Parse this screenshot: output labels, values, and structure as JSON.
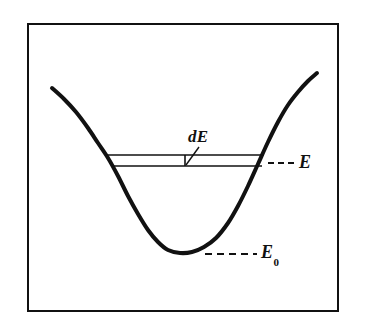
{
  "figure": {
    "kind": "potential-energy-well-diagram",
    "background_color": "#ffffff",
    "ink_color": "#111111",
    "frame": {
      "name": "figure-border",
      "x": 28,
      "y": 24,
      "width": 310,
      "height": 287,
      "stroke_width": 2
    },
    "labels": {
      "dE": "dE",
      "E": "E",
      "E0_base": "E",
      "E0_subscript": "0"
    }
  },
  "chart_data": {
    "type": "line",
    "title": "",
    "xlabel": "",
    "ylabel": "",
    "grid": false,
    "legend": null,
    "axis_ranges": {
      "x": [
        28,
        338
      ],
      "y": [
        24,
        311
      ]
    },
    "series": [
      {
        "name": "potential-energy-curve",
        "stroke_width": 4,
        "points": [
          [
            52,
            88
          ],
          [
            64,
            99
          ],
          [
            76,
            112
          ],
          [
            88,
            128
          ],
          [
            98,
            143
          ],
          [
            108,
            158
          ],
          [
            118,
            176
          ],
          [
            128,
            196
          ],
          [
            138,
            214
          ],
          [
            148,
            230
          ],
          [
            158,
            242
          ],
          [
            168,
            250
          ],
          [
            180,
            253
          ],
          [
            192,
            252
          ],
          [
            204,
            247
          ],
          [
            216,
            238
          ],
          [
            228,
            223
          ],
          [
            238,
            206
          ],
          [
            248,
            186
          ],
          [
            258,
            164
          ],
          [
            268,
            142
          ],
          [
            278,
            122
          ],
          [
            288,
            105
          ],
          [
            298,
            92
          ],
          [
            308,
            81
          ],
          [
            317,
            73
          ]
        ]
      }
    ],
    "annotations": [
      {
        "name": "energy-level-upper-line",
        "type": "hline",
        "y": 155,
        "x_start": 106,
        "x_end": 264,
        "style": "solid",
        "stroke_width": 1.6
      },
      {
        "name": "energy-level-lower-line",
        "type": "hline",
        "y": 166,
        "x_start": 112,
        "x_end": 262,
        "style": "solid",
        "stroke_width": 1.6
      },
      {
        "name": "dE-band-tick",
        "type": "vline",
        "x": 185,
        "y_start": 155,
        "y_end": 166,
        "style": "solid",
        "stroke_width": 1.6
      },
      {
        "name": "dE-leader-line",
        "type": "segment",
        "x1": 186,
        "y1": 165,
        "x2": 199,
        "y2": 147,
        "style": "solid",
        "stroke_width": 1.4
      },
      {
        "name": "E-dashed-leader",
        "type": "hline",
        "y": 163,
        "x_start": 268,
        "x_end": 295,
        "style": "dashed",
        "dash": "6 4",
        "stroke_width": 2
      },
      {
        "name": "E0-dashed-leader",
        "type": "hline",
        "y": 254,
        "x_start": 205,
        "x_end": 257,
        "style": "dashed",
        "dash": "7 5",
        "stroke_width": 2
      }
    ],
    "text_annotations": [
      {
        "name": "dE-label",
        "text": "dE",
        "x": 188,
        "y": 140
      },
      {
        "name": "E-label",
        "text": "E",
        "x": 299,
        "y": 165
      },
      {
        "name": "E0-label",
        "text": "E0",
        "x": 261,
        "y": 256
      }
    ]
  }
}
